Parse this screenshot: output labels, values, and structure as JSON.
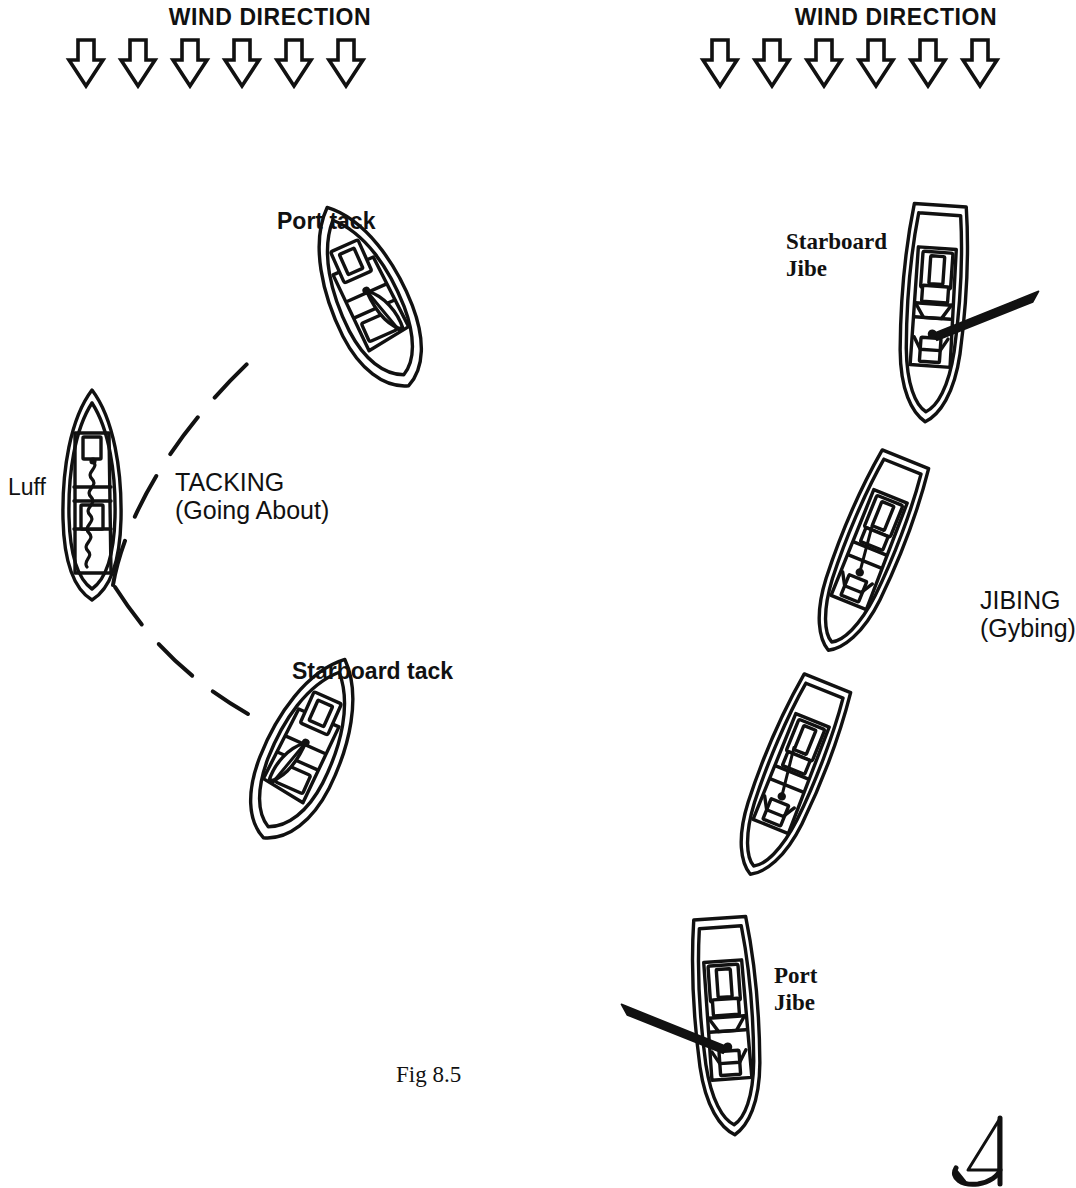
{
  "figure": {
    "caption": "Fig 8.5",
    "caption_x": 396,
    "caption_y": 1062
  },
  "wind_banners": [
    {
      "id": "wind-left",
      "label": "WIND DIRECTION",
      "label_x": 130,
      "label_y": 4,
      "arrow_count": 6,
      "arrow_start_x": 86,
      "arrow_spacing": 52,
      "arrow_y": 42,
      "arrow_icon": "arrow-down-hollow-icon"
    },
    {
      "id": "wind-right",
      "label": "WIND DIRECTION",
      "label_x": 756,
      "label_y": 4,
      "arrow_count": 6,
      "arrow_start_x": 712,
      "arrow_spacing": 52,
      "arrow_y": 42,
      "arrow_icon": "arrow-down-hollow-icon"
    }
  ],
  "tacking": {
    "title": "TACKING",
    "subtitle": "(Going About)",
    "title_x": 175,
    "title_y": 468,
    "labels": [
      {
        "id": "port-tack",
        "text": "Port tack",
        "x": 277,
        "y": 208,
        "weight": "bold",
        "font": "sans"
      },
      {
        "id": "luff",
        "text": "Luff",
        "x": 8,
        "y": 474,
        "weight": "normal",
        "font": "sans"
      },
      {
        "id": "starboard-tack",
        "text": "Starboard tack",
        "x": 292,
        "y": 658,
        "weight": "bold",
        "font": "sans"
      }
    ],
    "boats": [
      {
        "id": "boat-port-tack",
        "cx": 367,
        "cy": 297,
        "len": 196,
        "beam": 76,
        "rot": -22,
        "sails": "trimmed",
        "side": "port",
        "boom": "none"
      },
      {
        "id": "boat-luff",
        "cx": 92,
        "cy": 495,
        "len": 210,
        "beam": 58,
        "rot": 0,
        "sails": "luffing",
        "side": "none",
        "boom": "none"
      },
      {
        "id": "boat-starboard-tack",
        "cx": 305,
        "cy": 749,
        "len": 196,
        "beam": 76,
        "rot": 22,
        "sails": "trimmed",
        "side": "starboard",
        "boom": "none"
      }
    ],
    "paths": [
      {
        "id": "path-to-port-tack",
        "d": "M 113,585 C 118,520 150,430 262,350",
        "style": "dashed"
      },
      {
        "id": "path-to-starboard-tack",
        "d": "M 113,585 C 150,640 190,680 245,712",
        "style": "dashed"
      }
    ]
  },
  "jibing": {
    "title": "JIBING",
    "subtitle": "(Gybing)",
    "title_x": 983,
    "title_y": 586,
    "labels": [
      {
        "id": "starboard-jibe",
        "text": "Starboard\nJibe",
        "x": 786,
        "y": 228,
        "weight": "bold",
        "font": "serif"
      },
      {
        "id": "port-jibe",
        "text": "Port\nJibe",
        "x": 774,
        "y": 962,
        "weight": "bold",
        "font": "serif"
      }
    ],
    "boats": [
      {
        "id": "boat-starboard-jibe",
        "cx": 933,
        "cy": 310,
        "len": 214,
        "beam": 62,
        "rot": 4,
        "sails": "trimmed",
        "side": "none",
        "boom": "starboard"
      },
      {
        "id": "boat-jibe-mid-upper",
        "cx": 868,
        "cy": 552,
        "len": 206,
        "beam": 62,
        "rot": 22,
        "sails": "trimmed",
        "side": "none",
        "boom": "none"
      },
      {
        "id": "boat-jibe-mid-lower",
        "cx": 790,
        "cy": 776,
        "len": 206,
        "beam": 62,
        "rot": 22,
        "sails": "trimmed",
        "side": "none",
        "boom": "none"
      },
      {
        "id": "boat-port-jibe",
        "cx": 727,
        "cy": 1023,
        "len": 214,
        "beam": 62,
        "rot": -4,
        "sails": "trimmed",
        "side": "none",
        "boom": "port"
      }
    ]
  },
  "corner_sketch": {
    "id": "corner-sketch",
    "x": 952,
    "y": 1116,
    "description": "partial-sail-sketch"
  },
  "colors": {
    "ink": "#111111",
    "paper": "#ffffff"
  }
}
